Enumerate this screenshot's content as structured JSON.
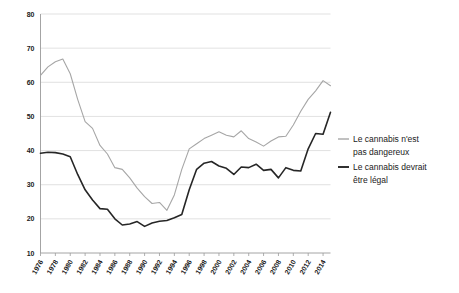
{
  "chart_data": {
    "type": "line",
    "title": "",
    "subtitle": "",
    "xlabel": "",
    "ylabel": "",
    "xlim": [
      1976,
      2015
    ],
    "ylim": [
      10,
      80
    ],
    "ytick_step": 10,
    "grid": true,
    "legend_position": "right",
    "yticks": [
      "80",
      "70",
      "60",
      "50",
      "40",
      "30",
      "20",
      "10"
    ],
    "ytick_values": [
      80,
      70,
      60,
      50,
      40,
      30,
      20,
      10
    ],
    "categories": [
      "1976",
      "1977",
      "1978",
      "1979",
      "1980",
      "1981",
      "1982",
      "1983",
      "1984",
      "1985",
      "1986",
      "1987",
      "1988",
      "1989",
      "1990",
      "1991",
      "1992",
      "1993",
      "1994",
      "1995",
      "1996",
      "1997",
      "1998",
      "1999",
      "2000",
      "2001",
      "2002",
      "2003",
      "2004",
      "2005",
      "2006",
      "2007",
      "2008",
      "2009",
      "2010",
      "2011",
      "2012",
      "2013",
      "2014",
      "2015"
    ],
    "xtick_labels": [
      "1976",
      "1978",
      "1980",
      "1982",
      "1984",
      "1986",
      "1988",
      "1990",
      "1992",
      "1994",
      "1996",
      "1998",
      "2000",
      "2002",
      "2004",
      "2006",
      "2008",
      "2010",
      "2012",
      "2014"
    ],
    "series": [
      {
        "name": "Le cannabis n'est pas dangereux",
        "color": "#a6a6a6",
        "width": 1.1,
        "values": [
          62.0,
          64.5,
          66.0,
          66.8,
          62.5,
          55.0,
          48.5,
          46.5,
          41.5,
          39.0,
          35.0,
          34.5,
          32.0,
          29.0,
          26.5,
          24.5,
          24.8,
          22.5,
          27.0,
          34.5,
          40.5,
          42.0,
          43.5,
          44.5,
          45.5,
          44.5,
          44.0,
          45.8,
          43.5,
          42.5,
          41.3,
          42.8,
          44.0,
          44.2,
          47.5,
          51.5,
          55.0,
          57.5,
          60.5,
          59.0
        ]
      },
      {
        "name": "Le cannabis devrait être légal",
        "color": "#262626",
        "width": 1.6,
        "values": [
          39.2,
          39.5,
          39.4,
          39.0,
          38.2,
          33.0,
          28.5,
          25.5,
          23.0,
          22.8,
          20.0,
          18.2,
          18.5,
          19.2,
          17.8,
          18.8,
          19.3,
          19.5,
          20.3,
          21.3,
          28.5,
          34.5,
          36.3,
          36.8,
          35.5,
          34.8,
          33.0,
          35.2,
          35.0,
          36.0,
          34.2,
          34.5,
          32.0,
          35.0,
          34.2,
          34.0,
          40.5,
          45.0,
          44.8,
          51.2
        ]
      }
    ]
  },
  "legend": {
    "entries": [
      {
        "label_line1": "Le cannabis n'est",
        "label_line2": "pas dangereux",
        "color": "#a6a6a6"
      },
      {
        "label_line1": "Le cannabis devrait",
        "label_line2": "être légal",
        "color": "#262626"
      }
    ]
  },
  "colors": {
    "background": "#ffffff",
    "axis": "#9a9a9a",
    "grid": "#d9d9d9",
    "text": "#1a1a1a",
    "series_gray": "#a6a6a6",
    "series_black": "#262626"
  }
}
